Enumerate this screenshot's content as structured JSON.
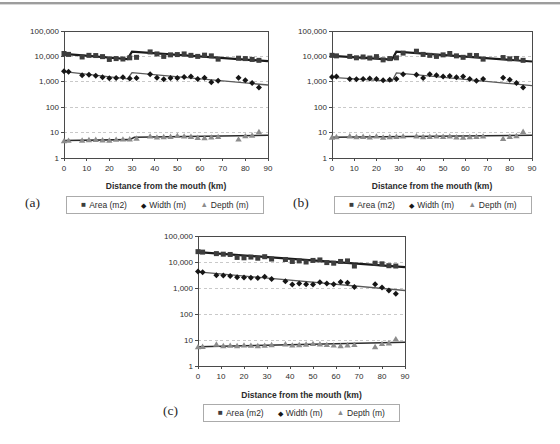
{
  "chart_data": [
    {
      "id": "a",
      "panel_label": "(a)",
      "type": "scatter",
      "y_scale": "log",
      "xlim": [
        0,
        90
      ],
      "ylim": [
        1,
        100000
      ],
      "xlabel": "Distance from the mouth (km)",
      "ylabel": "",
      "grid": "horizontal-dashed",
      "legend_position": "bottom",
      "x_ticks": [
        "0",
        "10",
        "20",
        "30",
        "40",
        "50",
        "60",
        "70",
        "80",
        "90"
      ],
      "y_ticks": [
        "1",
        "10",
        "100",
        "1,000",
        "10,000",
        "100,000"
      ],
      "x": [
        0,
        2,
        8,
        11,
        14,
        17,
        20,
        23,
        26,
        29,
        32,
        38,
        41,
        44,
        47,
        50,
        53,
        56,
        59,
        62,
        65,
        68,
        77,
        80,
        83,
        86
      ],
      "series": [
        {
          "name": "Area (m2)",
          "marker": "square",
          "marker_glyph": "■",
          "color": "#3d3d3d",
          "line_color": "#1a1a1a",
          "line_width": 2.2,
          "trend": [
            [
              0,
              12500
            ],
            [
              28,
              7800
            ],
            [
              30,
              15500
            ],
            [
              90,
              6500
            ]
          ],
          "values": [
            13000,
            12000,
            9500,
            11000,
            10800,
            9800,
            7600,
            8200,
            7900,
            8800,
            9200,
            15000,
            12500,
            10000,
            11500,
            11800,
            12500,
            11000,
            10000,
            11200,
            10500,
            7800,
            8500,
            8200,
            7600,
            7000
          ]
        },
        {
          "name": "Width (m)",
          "marker": "diamond",
          "marker_glyph": "◆",
          "color": "#161616",
          "line_color": "#5a5a5a",
          "line_width": 1.3,
          "trend": [
            [
              0,
              2500
            ],
            [
              28,
              1300
            ],
            [
              30,
              2300
            ],
            [
              90,
              750
            ]
          ],
          "values": [
            2600,
            2500,
            1800,
            1900,
            1750,
            1500,
            1380,
            1400,
            1500,
            1350,
            1400,
            2000,
            1450,
            1250,
            1400,
            1420,
            1550,
            1600,
            1300,
            1450,
            950,
            1100,
            1450,
            1150,
            900,
            600
          ]
        },
        {
          "name": "Depth (m)",
          "marker": "triangle",
          "marker_glyph": "▲",
          "color": "#8c8c8c",
          "line_color": "#2b2b2b",
          "line_width": 1.6,
          "trend": [
            [
              0,
              4.9
            ],
            [
              29,
              5.3
            ],
            [
              31,
              6.6
            ],
            [
              90,
              7.8
            ]
          ],
          "values": [
            4.7,
            4.9,
            5.0,
            5.2,
            5.3,
            5.1,
            5.0,
            5.4,
            5.5,
            5.6,
            6.0,
            7.2,
            6.6,
            6.8,
            7.0,
            7.6,
            7.2,
            7.0,
            6.4,
            6.2,
            6.6,
            6.9,
            5.5,
            7.4,
            7.8,
            10.8
          ]
        }
      ]
    },
    {
      "id": "b",
      "panel_label": "(b)",
      "type": "scatter",
      "y_scale": "log",
      "xlim": [
        0,
        90
      ],
      "ylim": [
        1,
        100000
      ],
      "xlabel": "Distance from the mouth (km)",
      "ylabel": "",
      "grid": "horizontal-dashed",
      "legend_position": "bottom",
      "x_ticks": [
        "0",
        "10",
        "20",
        "30",
        "40",
        "50",
        "60",
        "70",
        "80",
        "90"
      ],
      "y_ticks": [
        "1",
        "10",
        "100",
        "1,000",
        "10,000",
        "100,000"
      ],
      "x": [
        0,
        2,
        8,
        11,
        14,
        17,
        20,
        23,
        26,
        29,
        32,
        38,
        41,
        44,
        47,
        50,
        53,
        56,
        59,
        62,
        65,
        68,
        77,
        80,
        83,
        86
      ],
      "series": [
        {
          "name": "Area (m2)",
          "marker": "square",
          "marker_glyph": "■",
          "color": "#3d3d3d",
          "line_color": "#1a1a1a",
          "line_width": 2.2,
          "trend": [
            [
              0,
              10500
            ],
            [
              27,
              7500
            ],
            [
              29,
              15500
            ],
            [
              90,
              6300
            ]
          ],
          "values": [
            11000,
            10500,
            10000,
            8800,
            9500,
            8600,
            9800,
            7300,
            8200,
            8800,
            13500,
            16000,
            12000,
            11000,
            10000,
            11500,
            13000,
            10500,
            9200,
            11000,
            10800,
            7800,
            9000,
            8000,
            8300,
            7000
          ]
        },
        {
          "name": "Width (m)",
          "marker": "diamond",
          "marker_glyph": "◆",
          "color": "#161616",
          "line_color": "#5a5a5a",
          "line_width": 1.3,
          "trend": [
            [
              0,
              1500
            ],
            [
              27,
              1050
            ],
            [
              29,
              2250
            ],
            [
              90,
              700
            ]
          ],
          "values": [
            1550,
            1600,
            1300,
            1250,
            1300,
            1350,
            1300,
            1150,
            1200,
            1300,
            2000,
            1900,
            1400,
            2000,
            1800,
            1600,
            1700,
            1500,
            1600,
            1300,
            1100,
            1300,
            1450,
            1200,
            900,
            600
          ]
        },
        {
          "name": "Depth (m)",
          "marker": "triangle",
          "marker_glyph": "▲",
          "color": "#8c8c8c",
          "line_color": "#2b2b2b",
          "line_width": 1.6,
          "trend": [
            [
              0,
              6.6
            ],
            [
              90,
              7.8
            ]
          ],
          "values": [
            6.5,
            6.8,
            7.3,
            6.8,
            7.0,
            6.6,
            7.2,
            6.5,
            6.8,
            7.0,
            7.2,
            7.3,
            6.8,
            7.0,
            7.2,
            7.0,
            7.2,
            6.7,
            6.5,
            6.8,
            7.0,
            7.2,
            5.8,
            7.0,
            7.5,
            11.0
          ]
        }
      ]
    },
    {
      "id": "c",
      "panel_label": "(c)",
      "type": "scatter",
      "y_scale": "log",
      "xlim": [
        0,
        90
      ],
      "ylim": [
        1,
        100000
      ],
      "xlabel": "Distance from the mouth (km)",
      "ylabel": "",
      "grid": "horizontal-dashed",
      "legend_position": "bottom",
      "x_ticks": [
        "0",
        "10",
        "20",
        "30",
        "40",
        "50",
        "60",
        "70",
        "80",
        "90"
      ],
      "y_ticks": [
        "1",
        "10",
        "100",
        "1,000",
        "10,000",
        "100,000"
      ],
      "x": [
        0,
        2,
        8,
        11,
        14,
        17,
        20,
        23,
        26,
        29,
        32,
        38,
        41,
        44,
        47,
        50,
        53,
        56,
        59,
        62,
        65,
        68,
        77,
        80,
        83,
        86
      ],
      "series": [
        {
          "name": "Area (m2)",
          "marker": "square",
          "marker_glyph": "■",
          "color": "#3d3d3d",
          "line_color": "#1a1a1a",
          "line_width": 2.2,
          "trend": [
            [
              0,
              24000
            ],
            [
              90,
              6300
            ]
          ],
          "values": [
            25000,
            24000,
            21000,
            20000,
            19500,
            15000,
            14500,
            15500,
            14000,
            16000,
            13000,
            12500,
            10500,
            11000,
            10000,
            11500,
            12000,
            9500,
            9000,
            10500,
            11000,
            7000,
            9000,
            8500,
            7200,
            7000
          ]
        },
        {
          "name": "Width (m)",
          "marker": "diamond",
          "marker_glyph": "◆",
          "color": "#161616",
          "line_color": "#5a5a5a",
          "line_width": 1.3,
          "trend": [
            [
              0,
              4200
            ],
            [
              90,
              800
            ]
          ],
          "values": [
            4300,
            4000,
            3100,
            3000,
            2900,
            2600,
            2550,
            2500,
            2400,
            2700,
            2200,
            1800,
            1350,
            1500,
            1400,
            1350,
            1650,
            1500,
            1400,
            1700,
            1600,
            1100,
            1400,
            1050,
            800,
            600
          ]
        },
        {
          "name": "Depth (m)",
          "marker": "triangle",
          "marker_glyph": "▲",
          "color": "#8c8c8c",
          "line_color": "#2b2b2b",
          "line_width": 1.6,
          "trend": [
            [
              0,
              5.5
            ],
            [
              90,
              8.2
            ]
          ],
          "values": [
            5.4,
            5.6,
            6.8,
            6.0,
            6.2,
            6.0,
            6.3,
            6.2,
            6.0,
            6.2,
            6.5,
            7.0,
            6.3,
            6.5,
            6.8,
            7.2,
            7.0,
            6.6,
            6.3,
            6.0,
            6.4,
            6.6,
            5.5,
            7.2,
            7.6,
            11.0
          ]
        }
      ]
    }
  ]
}
